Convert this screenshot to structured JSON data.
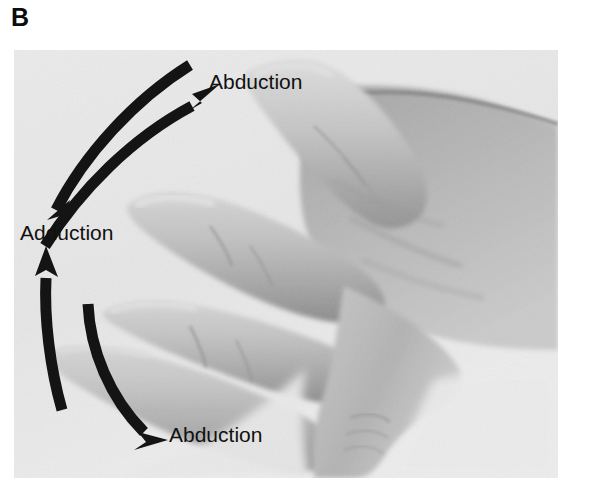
{
  "figure": {
    "panel_letter": "B",
    "caption_hidden": "",
    "background_color": "#ffffff"
  },
  "photo": {
    "name": "hand-dorsum-photograph",
    "description": "Grayscale photograph of a right hand, palm down, fingers spread apart showing abduction and adduction of the fingers",
    "background_color": "#e9e9e9",
    "skin_mid": "#b9b9b9",
    "skin_dark": "#8e8e8e",
    "skin_light": "#d8d8d8",
    "frame": {
      "x": 14,
      "y": 50,
      "width": 544,
      "height": 428
    }
  },
  "annotations": {
    "arrow_color": "#141414",
    "items": [
      {
        "id": "abduction-top",
        "label": "Abduction",
        "direction": "up-right",
        "arrow_name": "curved-arrow-abduction-top"
      },
      {
        "id": "adduction-middle",
        "label": "Adduction",
        "direction": "down-left-and-up-left",
        "arrow_name": "curved-arrow-adduction"
      },
      {
        "id": "abduction-bottom",
        "label": "Abduction",
        "direction": "down-right",
        "arrow_name": "curved-arrow-abduction-bottom"
      }
    ]
  }
}
